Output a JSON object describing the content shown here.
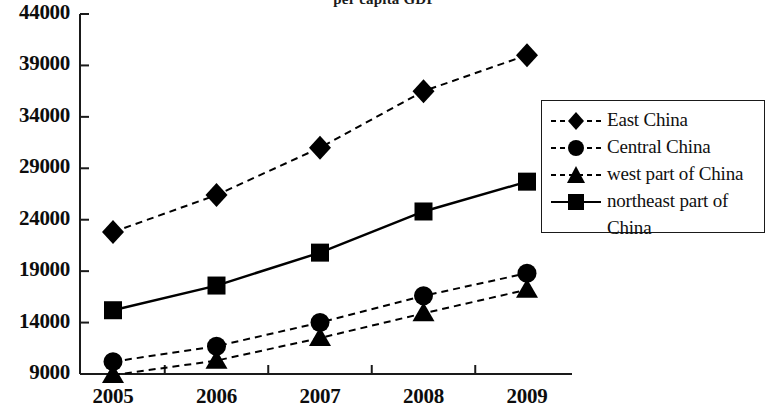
{
  "chart_data": {
    "type": "line",
    "title": "per capita GDP",
    "xlabel": "",
    "ylabel": "",
    "categories": [
      "2005",
      "2006",
      "2007",
      "2008",
      "2009"
    ],
    "x_tick_labels": [
      "2005",
      "2006",
      "2007",
      "2008",
      "2009"
    ],
    "y_tick_labels": [
      "9000",
      "14000",
      "19000",
      "24000",
      "29000",
      "34000",
      "39000",
      "44000"
    ],
    "y_ticks": [
      9000,
      14000,
      19000,
      24000,
      29000,
      34000,
      39000,
      44000
    ],
    "ylim": [
      9000,
      44000
    ],
    "grid": false,
    "legend_position": "right",
    "series": [
      {
        "name": "East China",
        "marker": "diamond",
        "linestyle": "dashed",
        "color": "#000000",
        "values": [
          22800,
          26400,
          31000,
          36500,
          40000
        ]
      },
      {
        "name": "Central China",
        "marker": "circle",
        "linestyle": "dashed",
        "color": "#000000",
        "values": [
          10200,
          11700,
          14000,
          16600,
          18800
        ]
      },
      {
        "name": "west part of China",
        "marker": "triangle",
        "linestyle": "dashed",
        "color": "#000000",
        "values": [
          8900,
          10300,
          12500,
          14900,
          17200
        ]
      },
      {
        "name": "northeast part of China",
        "marker": "square",
        "linestyle": "solid",
        "color": "#000000",
        "values": [
          15200,
          17600,
          20800,
          24800,
          27700
        ]
      }
    ]
  },
  "legend": {
    "entries": [
      {
        "label": "East China",
        "label_line2": ""
      },
      {
        "label": "Central China",
        "label_line2": ""
      },
      {
        "label": "west part of China",
        "label_line2": ""
      },
      {
        "label": "northeast part of",
        "label_line2": "China"
      }
    ]
  },
  "axes": {
    "axis_color": "#1a1a1a"
  }
}
